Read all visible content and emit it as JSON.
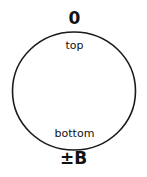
{
  "diagram": {
    "top_value": "0",
    "top_label": "top",
    "bottom_label": "bottom",
    "bottom_value": "±B",
    "stroke_color": "#1a1a1a",
    "text_color": "#111111"
  }
}
